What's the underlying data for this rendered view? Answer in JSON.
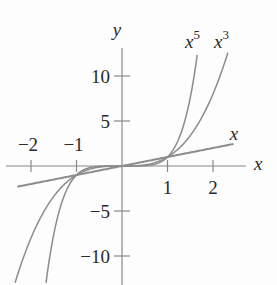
{
  "chart_data": {
    "type": "line",
    "title": "",
    "xlabel": "x",
    "ylabel": "y",
    "xlim": [
      -2.6,
      2.6
    ],
    "ylim": [
      -13,
      13
    ],
    "x_ticks": [
      -2,
      -1,
      1,
      2
    ],
    "x_tick_labels": [
      "−2",
      "−1",
      "1",
      "2"
    ],
    "y_ticks": [
      10,
      5,
      -5,
      -10
    ],
    "y_tick_labels": [
      "10",
      "5",
      "−5",
      "−10"
    ],
    "grid": false,
    "legend": "inline labels at curve ends",
    "series": [
      {
        "name": "x",
        "label": "x",
        "function": "y = x",
        "x_range": [
          -2.3,
          2.45
        ]
      },
      {
        "name": "x^3",
        "label": "x³",
        "function": "y = x^3",
        "x_range": [
          -2.35,
          2.35
        ]
      },
      {
        "name": "x^5",
        "label": "x⁵",
        "function": "y = x^5",
        "x_range": [
          -1.67,
          1.67
        ]
      }
    ],
    "intersections": [
      [
        -1,
        -1
      ],
      [
        0,
        0
      ],
      [
        1,
        1
      ]
    ]
  },
  "labels": {
    "x_axis": "x",
    "y_axis": "y",
    "curve_x": "x",
    "curve_x3_base": "x",
    "curve_x3_exp": "3",
    "curve_x5_base": "x",
    "curve_x5_exp": "5"
  },
  "colors": {
    "axis": "#8a8a8a",
    "curve": "#8c8c8c",
    "text": "#2a2a2a"
  }
}
